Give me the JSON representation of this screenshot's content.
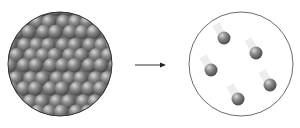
{
  "diagram": {
    "left_container": {
      "label": "dense-particles",
      "cx": 60,
      "cy": 64,
      "r": 53
    },
    "arrow": {
      "x1": 135,
      "x2": 166,
      "y": 65
    },
    "right_container": {
      "label": "sparse-particles",
      "cx": 241,
      "cy": 64,
      "r": 52,
      "particles": [
        [
          224,
          38
        ],
        [
          256,
          53
        ],
        [
          211,
          70
        ],
        [
          270,
          85
        ],
        [
          238,
          99
        ]
      ]
    },
    "colors": {
      "particle": "#7a7a7a",
      "outline": "#333333",
      "container_fill": "#ffffff"
    }
  }
}
